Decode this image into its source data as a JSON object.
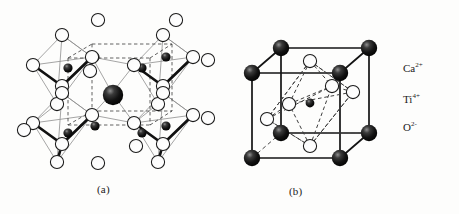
{
  "figure": {
    "kind": "crystal-structure-diagram",
    "compound": "CaTiO3",
    "structure_type": "perovskite",
    "background_color": "#fdfdfc",
    "line_color": "#1a1a1a",
    "panels": [
      {
        "id": "a",
        "label": "(a)",
        "description": "Network of corner-sharing TiO6 octahedra with Ca ion in the central cavity"
      },
      {
        "id": "b",
        "label": "(b)",
        "description": "Cubic unit cell: Ca at cube corners, Ti at body centre, O at face centres forming an octahedron"
      }
    ]
  },
  "legend": {
    "items": [
      {
        "key": "ca",
        "element": "Ca",
        "charge": "2+",
        "marker": "large-filled-sphere",
        "marker_color": "#0d0d0d",
        "marker_radius_px": 8
      },
      {
        "key": "ti",
        "element": "Ti",
        "charge": "4+",
        "marker": "small-filled-sphere",
        "marker_color": "#0d0d0d",
        "marker_radius_px": 4.6
      },
      {
        "key": "o",
        "element": "O",
        "charge": "2-",
        "marker": "open-circle",
        "marker_color": "#ffffff",
        "marker_stroke": "#1a1a1a",
        "marker_radius_px": 6.6
      }
    ]
  }
}
